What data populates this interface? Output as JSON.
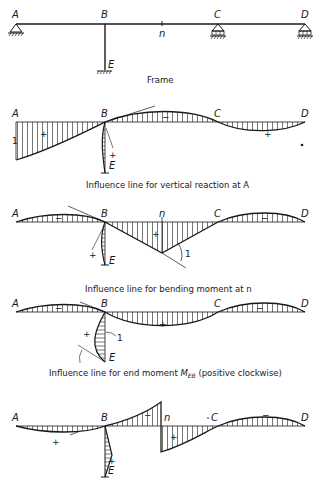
{
  "frame": {
    "caption": "Frame",
    "nodes": {
      "A": "A",
      "B": "B",
      "C": "C",
      "D": "D",
      "E": "E",
      "n": "n"
    }
  },
  "diagrams": [
    {
      "caption": "Influence line for vertical reaction at A",
      "unit_label": "1",
      "signs": [
        "+",
        "−",
        "+",
        "+"
      ]
    },
    {
      "caption": "Influence line for bending moment at n",
      "unit_label": "1",
      "signs": [
        "−",
        "+",
        "−",
        "+"
      ]
    },
    {
      "caption_prefix": "Influence line for end moment ",
      "caption_symbol": "M",
      "caption_sub": "EB",
      "caption_suffix": " (positive clockwise)",
      "unit_label": "1",
      "signs": [
        "−",
        "+",
        "−",
        "+"
      ]
    },
    {
      "caption": "",
      "signs": [
        "+",
        "−",
        "+",
        "−",
        "+"
      ]
    }
  ],
  "labels": {
    "A": "A",
    "B": "B",
    "C": "C",
    "D": "D",
    "E": "E",
    "n": "n"
  }
}
